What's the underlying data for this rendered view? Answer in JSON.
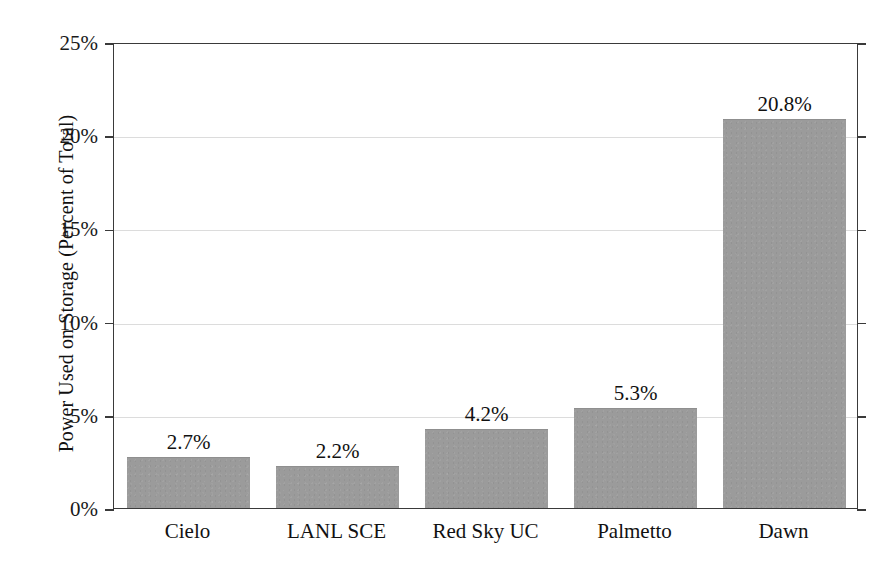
{
  "chart_data": {
    "type": "bar",
    "title": "",
    "subtitle": "",
    "xlabel": "",
    "ylabel": "Power Used on Storage (Percent of Total)",
    "categories": [
      "Cielo",
      "LANL SCE",
      "Red Sky UC",
      "Palmetto",
      "Dawn"
    ],
    "values": [
      2.7,
      2.2,
      4.2,
      5.3,
      20.8
    ],
    "value_labels": [
      "2.7%",
      "2.2%",
      "4.2%",
      "5.3%",
      "20.8%"
    ],
    "ylim": [
      0,
      25
    ],
    "y_ticks": [
      0,
      5,
      10,
      15,
      20,
      25
    ],
    "y_tick_labels": [
      "0%",
      "5%",
      "10%",
      "15%",
      "20%",
      "25%"
    ],
    "grid": "horizontal",
    "legend": "none",
    "bar_color": "#9b9b9b",
    "axis_color": "#3a3a3a",
    "gridline_color": "#dcdcdc",
    "text_color": "#111111",
    "background_color": "#ffffff",
    "series": [
      {
        "name": "Power Used on Storage",
        "values": [
          2.7,
          2.2,
          4.2,
          5.3,
          20.8
        ]
      }
    ]
  }
}
